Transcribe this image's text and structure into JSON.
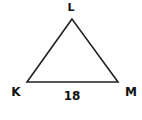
{
  "diagram": {
    "type": "triangle",
    "stroke_color": "#222222",
    "vertices": [
      {
        "name": "L",
        "x": 72,
        "y": 19
      },
      {
        "name": "K",
        "x": 27,
        "y": 82
      },
      {
        "name": "M",
        "x": 118,
        "y": 82
      }
    ],
    "labels": {
      "top": "L",
      "left": "K",
      "right": "M",
      "base_length": "18"
    }
  }
}
